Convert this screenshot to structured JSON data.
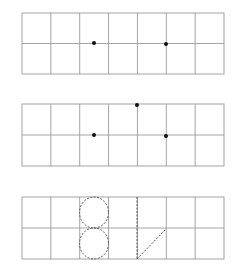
{
  "figure": {
    "width": 235,
    "height": 267,
    "colors": {
      "grid": "#9a9a9a",
      "dot": "#111111",
      "dashed": "#555555",
      "background": "#ffffff"
    },
    "grids": [
      {
        "id": "grid-1",
        "x": 22,
        "y": 13,
        "width": 202,
        "height": 61,
        "columns": 7,
        "rows": 2,
        "dots": [
          {
            "x": 94,
            "y": 43
          },
          {
            "x": 166,
            "y": 44
          }
        ]
      },
      {
        "id": "grid-2",
        "x": 22,
        "y": 104,
        "width": 202,
        "height": 62,
        "columns": 7,
        "rows": 2,
        "dots": [
          {
            "x": 94,
            "y": 135
          },
          {
            "x": 137,
            "y": 105
          },
          {
            "x": 166,
            "y": 136
          }
        ]
      },
      {
        "id": "grid-3",
        "x": 22,
        "y": 197,
        "width": 202,
        "height": 62,
        "columns": 7,
        "rows": 2,
        "shapes": {
          "figure_eight": {
            "cx": 94,
            "top_cy": 212.5,
            "bottom_cy": 243.5,
            "rx": 14.5,
            "ry": 15.5
          },
          "vertical_line": {
            "x1": 137,
            "y1": 197,
            "x2": 137,
            "y2": 259
          },
          "diagonal_line": {
            "x1": 137,
            "y1": 259,
            "x2": 166,
            "y2": 229
          }
        }
      }
    ]
  }
}
